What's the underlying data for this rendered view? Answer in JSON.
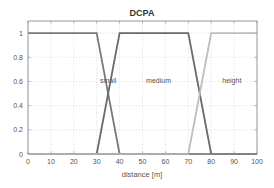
{
  "chart_data": {
    "type": "line",
    "title": "DCPA",
    "xlabel": "distance [m]",
    "ylabel": "",
    "xlim": [
      0,
      100
    ],
    "ylim": [
      0,
      1.1
    ],
    "grid": true,
    "x_ticks": [
      0,
      10,
      20,
      30,
      40,
      50,
      60,
      70,
      80,
      90,
      100
    ],
    "x_tick_labels": [
      "0",
      "10",
      "20",
      "30",
      "40",
      "50",
      "60",
      "70",
      "80",
      "90",
      "100"
    ],
    "y_ticks": [
      0,
      0.2,
      0.4,
      0.6,
      0.8,
      1
    ],
    "y_tick_labels": [
      "0",
      "0.2",
      "0.4",
      "0.6",
      "0.8",
      "1"
    ],
    "series": [
      {
        "name": "small",
        "color": "#7a7a7a",
        "x": [
          0,
          30,
          40,
          100
        ],
        "y": [
          1,
          1,
          0,
          0
        ],
        "label_pos": [
          35,
          0.6
        ]
      },
      {
        "name": "medium",
        "color": "#6a6a6a",
        "x": [
          0,
          30,
          40,
          70,
          80,
          100
        ],
        "y": [
          0,
          0,
          1,
          1,
          0,
          0
        ],
        "label_pos": [
          57,
          0.6
        ]
      },
      {
        "name": "height",
        "color": "#bdbdbd",
        "x": [
          0,
          70,
          80,
          100
        ],
        "y": [
          0,
          0,
          1,
          1
        ],
        "label_pos": [
          89,
          0.6
        ]
      }
    ],
    "annotations": [
      "small",
      "medium",
      "height"
    ]
  },
  "colors": {
    "axis": "#9a9a9a",
    "grid": "#d8d8d8",
    "text": "#555555",
    "title": "#333333"
  }
}
